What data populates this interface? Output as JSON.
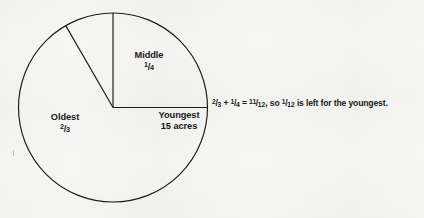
{
  "figure": {
    "type": "pie-diagram",
    "background_color": "#f6f6f4",
    "stroke_color": "#1a1a1a",
    "annotation": {
      "prefix": "",
      "text_full": "2/3 + 1/4 = 11/12, so 1/12 is left for the youngest.",
      "seg_a_num": "2",
      "seg_a_bar": "/",
      "seg_a_den": "3",
      "seg_plus": " + ",
      "seg_b_num": "1",
      "seg_b_bar": "/",
      "seg_b_den": "4",
      "seg_eq": " = ",
      "seg_c_num": "11",
      "seg_c_bar": "/",
      "seg_c_den": "12",
      "seg_mid": ", so ",
      "seg_d_num": "1",
      "seg_d_bar": "/",
      "seg_d_den": "12",
      "seg_tail": " is left for the youngest."
    }
  },
  "chart_data": {
    "type": "pie",
    "title": "",
    "categories": [
      "Middle",
      "Oldest",
      "Youngest"
    ],
    "values": [
      0.25,
      0.6666666667,
      0.0833333333
    ],
    "value_labels": [
      "1/4",
      "2/3",
      "1/12"
    ],
    "units": "fraction of land",
    "start_angle_deg": -90,
    "direction": "clockwise",
    "legend": "none",
    "grid": false,
    "slices": [
      {
        "name": "Middle",
        "fraction_text_num": "1",
        "fraction_text_bar": "/",
        "fraction_text_den": "4",
        "value": 0.25,
        "angle_deg": 90,
        "start_deg": -90,
        "end_deg": 0,
        "label_line1": "Middle",
        "label_line2": ""
      },
      {
        "name": "Oldest",
        "fraction_text_num": "2",
        "fraction_text_bar": "/",
        "fraction_text_den": "3",
        "value": 0.6666666667,
        "angle_deg": 240,
        "start_deg": 30,
        "end_deg": 270,
        "label_line1": "Oldest",
        "label_line2": ""
      },
      {
        "name": "Youngest",
        "fraction_text_num": "",
        "fraction_text_bar": "",
        "fraction_text_den": "",
        "value": 0.0833333333,
        "angle_deg": 30,
        "start_deg": 0,
        "end_deg": 30,
        "label_line1": "Youngest",
        "label_line2": "15 acres"
      }
    ]
  },
  "geometry": {
    "center_x": 113,
    "center_y": 107.5,
    "radius": 94.5
  }
}
